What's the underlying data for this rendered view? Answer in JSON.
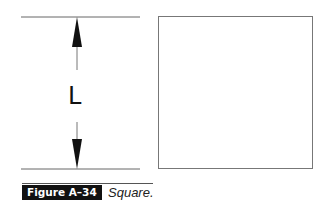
{
  "figure": {
    "dimension_label": "L",
    "caption_label": "Figure A–34",
    "caption_text": "Square.",
    "colors": {
      "line": "#555555",
      "arrow": "#111111",
      "tag_bg": "#111111",
      "tag_text": "#ffffff"
    }
  }
}
